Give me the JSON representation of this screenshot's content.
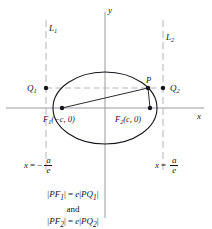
{
  "figure": {
    "axes": {
      "x_label": "x",
      "y_label": "y"
    },
    "directrices": [
      {
        "name": "L1",
        "label": "L",
        "sub": "1",
        "equation_lhs": "x",
        "equation_sign": "=",
        "equation_minus": "−",
        "numerator": "a",
        "denominator": "e"
      },
      {
        "name": "L2",
        "label": "L",
        "sub": "2",
        "equation_lhs": "x",
        "equation_sign": "=",
        "equation_minus": "",
        "numerator": "a",
        "denominator": "e"
      }
    ],
    "points": {
      "focus1": {
        "label": "F",
        "sub": "1",
        "coords": "(−c, 0)"
      },
      "focus2": {
        "label": "F",
        "sub": "2",
        "coords": "(c, 0)"
      },
      "p": {
        "label": "P"
      },
      "q1": {
        "label": "Q",
        "sub": "1"
      },
      "q2": {
        "label": "Q",
        "sub": "2"
      }
    },
    "relations": {
      "line1": {
        "bar": "|",
        "pf": "PF",
        "sub1": "1",
        "bar2": "|",
        "eq": "=",
        "e": "e",
        "bar3": "|",
        "pq": "PQ",
        "sub2": "1",
        "bar4": "|"
      },
      "and": "and",
      "line2": {
        "bar": "|",
        "pf": "PF",
        "sub1": "2",
        "bar2": "|",
        "eq": "=",
        "e": "e",
        "bar3": "|",
        "pq": "PQ",
        "sub2": "2",
        "bar4": "|"
      }
    },
    "colors": {
      "ink": "#15151a",
      "axis": "#9a9aa0",
      "dashed": "#b4b4ba",
      "background": "#ffffff"
    }
  }
}
